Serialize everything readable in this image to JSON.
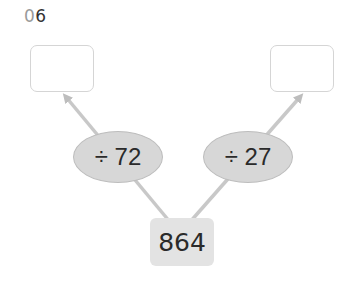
{
  "problem": {
    "number_prefix": "0",
    "number_suffix": "6"
  },
  "diagram": {
    "start_value": "864",
    "left_operation": "÷ 72",
    "right_operation": "÷ 27",
    "left_answer": "",
    "right_answer": "",
    "line_color": "#c8c8c8",
    "oval_color": "#d7d7d7",
    "start_box_color": "#e3e3e3"
  }
}
